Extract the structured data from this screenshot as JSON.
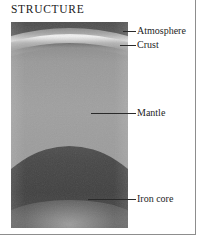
{
  "figure": {
    "title": "STRUCTURE",
    "colors": {
      "sky": "#4d4d4d",
      "atmosphere": "#e8e8e8",
      "crust": "#7d7d7d",
      "mantle": "#9a9a9a",
      "iron_core": "#454545",
      "frame": "#8d8d8d",
      "text": "#1e1e1e"
    }
  },
  "labels": [
    {
      "id": "atmosphere",
      "text": "Atmosphere"
    },
    {
      "id": "crust",
      "text": "Crust"
    },
    {
      "id": "mantle",
      "text": "Mantle"
    },
    {
      "id": "iron-core",
      "text": "Iron core"
    }
  ]
}
